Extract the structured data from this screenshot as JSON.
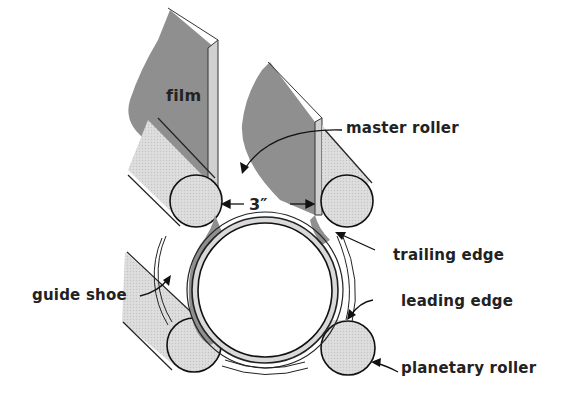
{
  "diagram": {
    "labels": {
      "film": "film",
      "master_roller": "master roller",
      "dimension": "3″",
      "trailing_edge": "trailing edge",
      "guide_shoe": "guide shoe",
      "leading_edge": "leading edge",
      "planetary_roller": "planetary roller"
    },
    "colors": {
      "film_gray": "#8f8f8f",
      "roller_light": "#d9d9d9",
      "line": "#1a1a1a",
      "background": "#ffffff"
    }
  }
}
